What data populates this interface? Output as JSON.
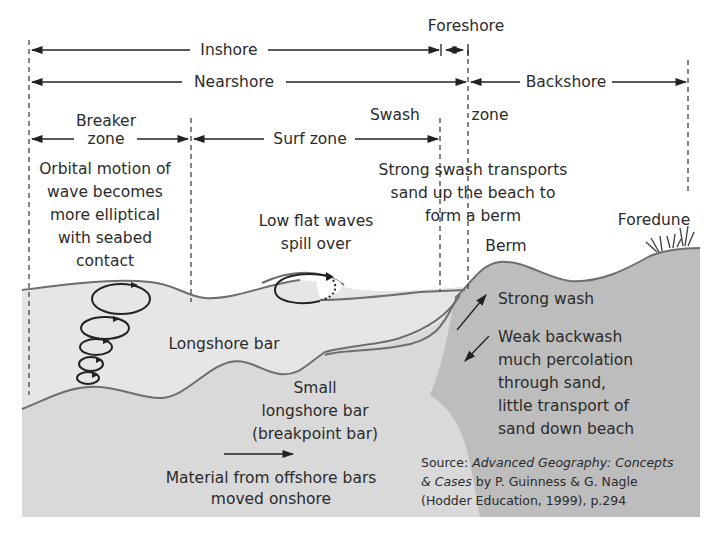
{
  "colors": {
    "background": "#ffffff",
    "sea": "#e6e6e6",
    "seabed": "#d9d9d9",
    "beach": "#bdbdbd",
    "outline": "#6e6e6e",
    "ink": "#2b2b2b"
  },
  "zones": {
    "inshore": "Inshore",
    "foreshore": "Foreshore",
    "nearshore": "Nearshore",
    "backshore": "Backshore",
    "breaker_zone": [
      "Breaker",
      "zone"
    ],
    "surf_zone": "Surf zone",
    "swash_zone": [
      "Swash",
      "zone"
    ]
  },
  "annotations": {
    "orbital": [
      "Orbital motion of",
      "wave becomes",
      "more elliptical",
      "with seabed",
      "contact"
    ],
    "low_flat_waves": [
      "Low flat waves",
      "spill over"
    ],
    "strong_swash": [
      "Strong swash transports",
      "sand up the beach to",
      "form a berm"
    ],
    "foredune": "Foredune",
    "berm": "Berm",
    "longshore_bar": "Longshore bar",
    "strong_wash": "Strong wash",
    "backwash": [
      "Weak backwash",
      "much percolation",
      "through sand,",
      "little transport of",
      "sand down beach"
    ],
    "small_bar": [
      "Small",
      "longshore bar",
      "(breakpoint bar)"
    ],
    "material": [
      "Material from offshore bars",
      "moved onshore"
    ]
  },
  "source": {
    "prefix": "Source: ",
    "title_italic_1": "Advanced Geography: Concepts",
    "title_italic_2": "& Cases",
    "line2_rest": " by P. Guinness & G. Nagle",
    "line3": "(Hodder Education, 1999), p.294"
  }
}
